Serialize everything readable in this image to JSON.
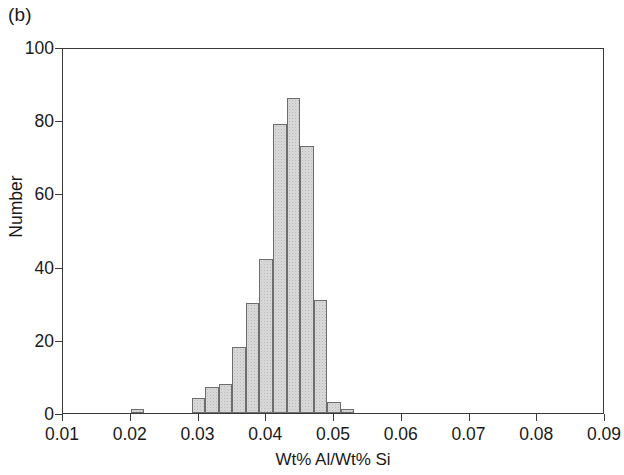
{
  "figure": {
    "panel_label": "(b)",
    "background_color": "#ffffff",
    "frame_color": "#3a3a3a"
  },
  "chart_data": {
    "type": "bar",
    "subtype": "histogram",
    "title": "",
    "panel_label": "(b)",
    "xlabel": "Wt% Al/Wt% Si",
    "ylabel": "Number",
    "xlim": [
      0.01,
      0.09
    ],
    "ylim": [
      0,
      100
    ],
    "xticks": [
      0.01,
      0.02,
      0.03,
      0.04,
      0.05,
      0.06,
      0.07,
      0.08,
      0.09
    ],
    "xtick_labels": [
      "0.01",
      "0.02",
      "0.03",
      "0.04",
      "0.05",
      "0.06",
      "0.07",
      "0.08",
      "0.09"
    ],
    "yticks": [
      0,
      20,
      40,
      60,
      80,
      100
    ],
    "ytick_labels": [
      "0",
      "20",
      "40",
      "60",
      "80",
      "100"
    ],
    "grid": false,
    "legend": null,
    "bin_width": 0.002,
    "bar_fill_color": "#d9d9d9",
    "bar_edge_color": "#6d6d6d",
    "bins": [
      {
        "left": 0.02,
        "right": 0.022,
        "center": 0.021,
        "value": 1
      },
      {
        "left": 0.029,
        "right": 0.031,
        "center": 0.03,
        "value": 4
      },
      {
        "left": 0.031,
        "right": 0.033,
        "center": 0.032,
        "value": 7
      },
      {
        "left": 0.033,
        "right": 0.035,
        "center": 0.034,
        "value": 8
      },
      {
        "left": 0.035,
        "right": 0.037,
        "center": 0.036,
        "value": 18
      },
      {
        "left": 0.037,
        "right": 0.039,
        "center": 0.038,
        "value": 30
      },
      {
        "left": 0.039,
        "right": 0.041,
        "center": 0.04,
        "value": 42
      },
      {
        "left": 0.041,
        "right": 0.043,
        "center": 0.042,
        "value": 79
      },
      {
        "left": 0.043,
        "right": 0.045,
        "center": 0.044,
        "value": 86
      },
      {
        "left": 0.045,
        "right": 0.047,
        "center": 0.046,
        "value": 73
      },
      {
        "left": 0.047,
        "right": 0.049,
        "center": 0.048,
        "value": 31
      },
      {
        "left": 0.049,
        "right": 0.051,
        "center": 0.05,
        "value": 3
      },
      {
        "left": 0.051,
        "right": 0.053,
        "center": 0.052,
        "value": 1
      }
    ],
    "categories": [
      "0.021",
      "0.030",
      "0.032",
      "0.034",
      "0.036",
      "0.038",
      "0.040",
      "0.042",
      "0.044",
      "0.046",
      "0.048",
      "0.050",
      "0.052"
    ],
    "values": [
      1,
      4,
      7,
      8,
      18,
      30,
      42,
      79,
      86,
      73,
      31,
      3,
      1
    ]
  }
}
